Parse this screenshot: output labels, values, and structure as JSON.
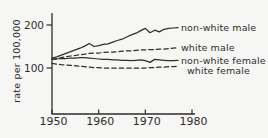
{
  "figure": {
    "background_color": "#f6f6f4",
    "ink_color": "#2e2e2e"
  },
  "chart_data": {
    "type": "line",
    "title": "",
    "xlabel": "",
    "ylabel": "rate per 100,000",
    "xlim": [
      1950,
      1980
    ],
    "ylim": [
      0,
      230
    ],
    "grid": false,
    "legend_position": "inline-right",
    "x_ticks": [
      1950,
      1960,
      1970,
      1980
    ],
    "y_ticks": [
      100,
      200
    ],
    "x": [
      1950,
      1951,
      1952,
      1953,
      1954,
      1955,
      1956,
      1957,
      1958,
      1959,
      1960,
      1961,
      1962,
      1963,
      1964,
      1965,
      1966,
      1967,
      1968,
      1969,
      1970,
      1971,
      1972,
      1973,
      1974,
      1975,
      1976,
      1977
    ],
    "series": [
      {
        "name": "non-white male",
        "line_style": "solid",
        "values": [
          123,
          126,
          130,
          134,
          138,
          142,
          146,
          151,
          157,
          150,
          152,
          155,
          156,
          160,
          164,
          167,
          172,
          177,
          181,
          187,
          192,
          182,
          188,
          184,
          190,
          192,
          193,
          194
        ]
      },
      {
        "name": "white male",
        "line_style": "dashed",
        "values": [
          120,
          122,
          124,
          126,
          128,
          129,
          131,
          132,
          134,
          135,
          135,
          136,
          137,
          137,
          138,
          139,
          140,
          140,
          141,
          142,
          142,
          143,
          143,
          144,
          144,
          145,
          146,
          147
        ]
      },
      {
        "name": "non-white female",
        "line_style": "solid",
        "values": [
          121,
          121,
          122,
          122,
          123,
          123,
          124,
          124,
          123,
          122,
          121,
          120,
          120,
          119,
          119,
          118,
          118,
          117,
          118,
          119,
          117,
          113,
          120,
          119,
          118,
          117,
          117,
          118
        ]
      },
      {
        "name": "white female",
        "line_style": "dashed",
        "values": [
          111,
          109,
          108,
          107,
          106,
          105,
          104,
          103,
          102,
          101,
          101,
          100,
          100,
          100,
          100,
          100,
          100,
          100,
          100,
          100,
          100,
          101,
          101,
          102,
          102,
          103,
          103,
          104
        ]
      }
    ]
  }
}
